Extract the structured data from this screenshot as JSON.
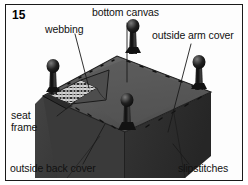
{
  "figure": {
    "number": "15",
    "domain_type": "technical-illustration"
  },
  "labels": [
    {
      "id": "bottom-canvas",
      "text": "bottom canvas"
    },
    {
      "id": "webbing",
      "text": "webbing"
    },
    {
      "id": "outside-arm-cover",
      "text": "outside arm cover"
    },
    {
      "id": "seat-frame",
      "text": "seat\nframe",
      "line1": "seat",
      "line2": "frame"
    },
    {
      "id": "outside-back-cover",
      "text": "outside back cover"
    },
    {
      "id": "slipstitches",
      "text": "slipstitches"
    }
  ],
  "colors": {
    "page_background": "#ffffff",
    "frame_border": "#1a1a1a",
    "label_text": "#111111",
    "leader_line": "#1a1a1a",
    "canvas_top": "#5b5b5b",
    "canvas_top_shadow": "#4a4a4a",
    "side_panel_left": "#3a3a3a",
    "side_panel_right": "#2f2f2f",
    "back_cover": "#343434",
    "leg_dark": "#151515",
    "leg_highlight": "#6a6a6a",
    "webbing_light": "#d8d8d8",
    "stitch_mark": "#111111"
  },
  "parts_count": {
    "legs": 4,
    "visible_panels": 3
  }
}
